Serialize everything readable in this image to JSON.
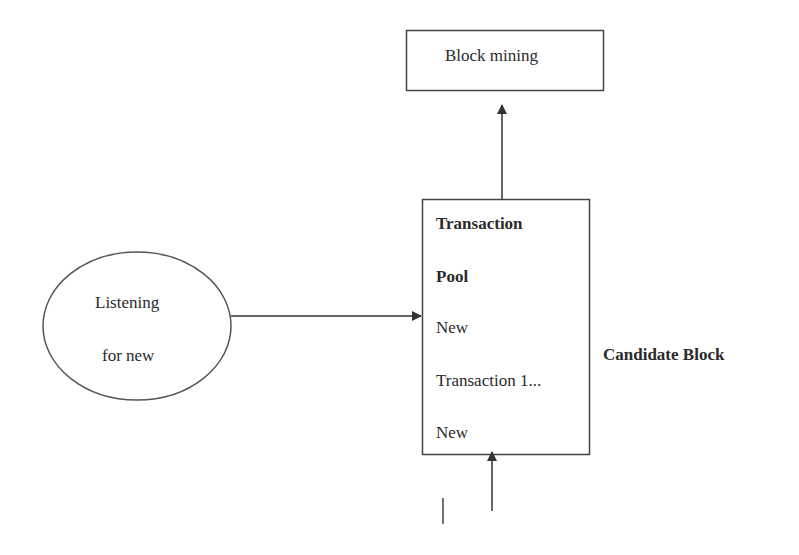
{
  "diagram": {
    "nodes": {
      "block_mining": {
        "label": "Block mining"
      },
      "listener": {
        "lines": [
          "Listening",
          "for new"
        ]
      },
      "transaction_pool": {
        "title_lines": [
          "Transaction",
          "Pool"
        ],
        "items": [
          "New",
          "Transaction 1...",
          "New"
        ]
      },
      "candidate_block": {
        "label": "Candidate Block"
      }
    },
    "edges": [
      {
        "from": "listener",
        "to": "transaction_pool"
      },
      {
        "from": "transaction_pool",
        "to": "block_mining"
      },
      {
        "from": "below",
        "to": "transaction_pool"
      }
    ],
    "colors": {
      "stroke": "#333333",
      "background": "#ffffff",
      "text": "#2a2a2a"
    }
  }
}
